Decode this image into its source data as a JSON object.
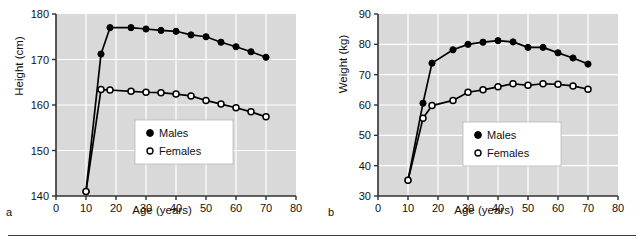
{
  "figure": {
    "background": "#ffffff",
    "plot_background": "#d9d9d9",
    "gridline_color": "#ffffff",
    "axis_color": "#303030",
    "series_color": "#000000",
    "panels": [
      {
        "letter": "a"
      },
      {
        "letter": "b"
      }
    ]
  },
  "legend": {
    "males_label": "Males",
    "females_label": "Females",
    "males_marker": "filled-circle",
    "females_marker": "open-circle",
    "position": "center-right-inside"
  },
  "chart_data": [
    {
      "panel": "a",
      "type": "line",
      "title": "",
      "xlabel": "Age (years)",
      "ylabel": "Height (cm)",
      "xlim": [
        0,
        80
      ],
      "ylim": [
        140,
        180
      ],
      "xticks": [
        0,
        10,
        20,
        30,
        40,
        50,
        60,
        70,
        80
      ],
      "yticks": [
        140,
        150,
        160,
        170,
        180
      ],
      "xtick_labels": [
        "0",
        "10",
        "20",
        "30",
        "40",
        "50",
        "60",
        "70",
        "80"
      ],
      "ytick_labels": [
        "140",
        "150",
        "160",
        "170",
        "180"
      ],
      "grid": true,
      "legend": [
        "Males",
        "Females"
      ],
      "x": [
        10,
        15,
        18,
        25,
        30,
        35,
        40,
        45,
        50,
        55,
        60,
        65,
        70
      ],
      "series": [
        {
          "name": "Males",
          "marker": "filled-circle",
          "values": [
            141.0,
            171.2,
            177.0,
            177.0,
            176.7,
            176.4,
            176.2,
            175.4,
            175.0,
            173.8,
            172.8,
            171.7,
            170.5
          ]
        },
        {
          "name": "Females",
          "marker": "open-circle",
          "values": [
            141.0,
            163.4,
            163.3,
            163.0,
            162.8,
            162.7,
            162.4,
            162.0,
            161.0,
            160.2,
            159.4,
            158.5,
            157.4
          ]
        }
      ]
    },
    {
      "panel": "b",
      "type": "line",
      "title": "",
      "xlabel": "Age (years)",
      "ylabel": "Weight (kg)",
      "xlim": [
        0,
        80
      ],
      "ylim": [
        30,
        90
      ],
      "xticks": [
        0,
        10,
        20,
        30,
        40,
        50,
        60,
        70,
        80
      ],
      "yticks": [
        30,
        40,
        50,
        60,
        70,
        80,
        90
      ],
      "xtick_labels": [
        "0",
        "10",
        "20",
        "30",
        "40",
        "50",
        "60",
        "70",
        "80"
      ],
      "ytick_labels": [
        "30",
        "40",
        "50",
        "60",
        "70",
        "80",
        "90"
      ],
      "grid": true,
      "legend": [
        "Males",
        "Females"
      ],
      "x": [
        10,
        15,
        18,
        25,
        30,
        35,
        40,
        45,
        50,
        55,
        60,
        65,
        70
      ],
      "series": [
        {
          "name": "Males",
          "marker": "filled-circle",
          "values": [
            35.2,
            60.6,
            73.8,
            78.2,
            80.0,
            80.7,
            81.2,
            80.8,
            79.0,
            79.0,
            77.2,
            75.5,
            73.5
          ]
        },
        {
          "name": "Females",
          "marker": "open-circle",
          "values": [
            35.2,
            55.6,
            59.8,
            61.5,
            64.2,
            65.0,
            66.0,
            67.0,
            66.5,
            67.0,
            66.8,
            66.3,
            65.2
          ]
        }
      ]
    }
  ]
}
